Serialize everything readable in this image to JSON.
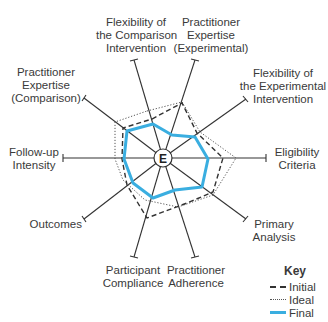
{
  "diagram": {
    "center_label": "E",
    "spokes": [
      {
        "id": "flex-comparison",
        "lines": [
          "Flexibility of",
          "the Comparison",
          "Intervention"
        ]
      },
      {
        "id": "pract-expertise-exp",
        "lines": [
          "Practitioner",
          "Expertise",
          "(Experimental)"
        ]
      },
      {
        "id": "flex-experimental",
        "lines": [
          "Flexibility of",
          "the Experimental",
          "Intervention"
        ]
      },
      {
        "id": "eligibility",
        "lines": [
          "Eligibility",
          "Criteria"
        ]
      },
      {
        "id": "primary-analysis",
        "lines": [
          "Primary",
          "Analysis"
        ]
      },
      {
        "id": "pract-adherence",
        "lines": [
          "Practitioner",
          "Adherence"
        ]
      },
      {
        "id": "participant-compliance",
        "lines": [
          "Participant",
          "Compliance"
        ]
      },
      {
        "id": "outcomes",
        "lines": [
          "Outcomes"
        ]
      },
      {
        "id": "followup",
        "lines": [
          "Follow-up",
          "Intensity"
        ]
      },
      {
        "id": "pract-expertise-comp",
        "lines": [
          "Practitioner",
          "Expertise",
          "(Comparison)"
        ]
      }
    ],
    "key": {
      "title": "Key",
      "items": [
        {
          "label": "Initial",
          "style": "dashed",
          "color": "#333333"
        },
        {
          "label": "Ideal",
          "style": "dotted",
          "color": "#555555"
        },
        {
          "label": "Final",
          "style": "solid",
          "color": "#3aaee0"
        }
      ]
    },
    "series": {
      "initial": [
        [
          152,
          119
        ],
        [
          182,
          103
        ],
        [
          197,
          133
        ],
        [
          223,
          158
        ],
        [
          213,
          192
        ],
        [
          187,
          203
        ],
        [
          147,
          218
        ],
        [
          127,
          185
        ],
        [
          122,
          159
        ],
        [
          123,
          128
        ]
      ],
      "ideal": [
        [
          147,
          111
        ],
        [
          182,
          102
        ],
        [
          200,
          132
        ],
        [
          236,
          158
        ],
        [
          213,
          195
        ],
        [
          178,
          207
        ],
        [
          145,
          200
        ],
        [
          123,
          180
        ],
        [
          115,
          159
        ],
        [
          115,
          122
        ]
      ],
      "final": [
        [
          153,
          124
        ],
        [
          172,
          135
        ],
        [
          195,
          137
        ],
        [
          208,
          159
        ],
        [
          202,
          187
        ],
        [
          175,
          190
        ],
        [
          153,
          198
        ],
        [
          133,
          183
        ],
        [
          124,
          159
        ],
        [
          127,
          131
        ]
      ]
    }
  }
}
